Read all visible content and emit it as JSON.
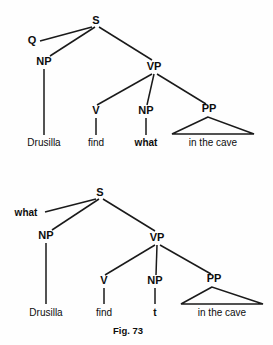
{
  "figure": {
    "caption": "Fig. 73",
    "caption_x": 128,
    "caption_y": 334,
    "caption_size": 9.5,
    "width": 273,
    "height": 345,
    "ink_color": "#1a1a1a",
    "background_color": "#fefefe"
  },
  "trees": [
    {
      "id": "tree-deep-structure",
      "name": "wh-question-deep-structure",
      "nodes": [
        {
          "id": "t1-S",
          "label": "S",
          "x": 96,
          "y": 24,
          "size": 11,
          "bold": true
        },
        {
          "id": "t1-Q",
          "label": "Q",
          "x": 32,
          "y": 44,
          "size": 11,
          "bold": true
        },
        {
          "id": "t1-NP",
          "label": "NP",
          "x": 44,
          "y": 65,
          "size": 11,
          "bold": true
        },
        {
          "id": "t1-VP",
          "label": "VP",
          "x": 154,
          "y": 70,
          "size": 11,
          "bold": true
        },
        {
          "id": "t1-V",
          "label": "V",
          "x": 96,
          "y": 114,
          "size": 11,
          "bold": true
        },
        {
          "id": "t1-NP2",
          "label": "NP",
          "x": 146,
          "y": 114,
          "size": 11,
          "bold": true
        },
        {
          "id": "t1-PP",
          "label": "PP",
          "x": 209,
          "y": 112,
          "size": 11,
          "bold": true
        }
      ],
      "edges": [
        {
          "name": "edge-S-Q",
          "x1": 92,
          "y1": 27,
          "x2": 40,
          "y2": 41
        },
        {
          "name": "edge-S-NP",
          "x1": 95,
          "y1": 27,
          "x2": 50,
          "y2": 56
        },
        {
          "name": "edge-S-VP",
          "x1": 99,
          "y1": 27,
          "x2": 152,
          "y2": 60
        },
        {
          "name": "edge-NP-Drusilla",
          "x1": 44,
          "y1": 69,
          "x2": 44,
          "y2": 135
        },
        {
          "name": "edge-VP-V",
          "x1": 152,
          "y1": 74,
          "x2": 97,
          "y2": 105
        },
        {
          "name": "edge-VP-NP",
          "x1": 154,
          "y1": 74,
          "x2": 147,
          "y2": 105
        },
        {
          "name": "edge-VP-PP",
          "x1": 157,
          "y1": 74,
          "x2": 206,
          "y2": 104
        },
        {
          "name": "edge-V-find",
          "x1": 96,
          "y1": 118,
          "x2": 96,
          "y2": 135
        },
        {
          "name": "edge-NP2-what",
          "x1": 146,
          "y1": 118,
          "x2": 146,
          "y2": 135
        }
      ],
      "triangles": [
        {
          "name": "pp-triangle",
          "apex_x": 208,
          "apex_y": 117,
          "left_x": 172,
          "right_x": 254,
          "base_y": 134
        }
      ],
      "leaves": [
        {
          "id": "t1-leaf-1",
          "name": "leaf-drusilla",
          "label": "Drusilla",
          "x": 44,
          "y": 146,
          "size": 10,
          "bold": false
        },
        {
          "id": "t1-leaf-2",
          "name": "leaf-find",
          "label": "find",
          "x": 96,
          "y": 146,
          "size": 10,
          "bold": false
        },
        {
          "id": "t1-leaf-3",
          "name": "leaf-what",
          "label": "what",
          "x": 146,
          "y": 146,
          "size": 10,
          "bold": true
        },
        {
          "id": "t1-leaf-4",
          "name": "leaf-in-the-cave",
          "label": "in the cave",
          "x": 213,
          "y": 146,
          "size": 10,
          "bold": false
        }
      ]
    },
    {
      "id": "tree-surface-structure",
      "name": "wh-question-surface-structure",
      "nodes": [
        {
          "id": "t2-S",
          "label": "S",
          "x": 100,
          "y": 196,
          "size": 11,
          "bold": true
        },
        {
          "id": "t2-NP",
          "label": "NP",
          "x": 46,
          "y": 239,
          "size": 11,
          "bold": true
        },
        {
          "id": "t2-VP",
          "label": "VP",
          "x": 157,
          "y": 241,
          "size": 11,
          "bold": true
        },
        {
          "id": "t2-V",
          "label": "V",
          "x": 104,
          "y": 284,
          "size": 11,
          "bold": true
        },
        {
          "id": "t2-NP2",
          "label": "NP",
          "x": 155,
          "y": 284,
          "size": 11,
          "bold": true
        },
        {
          "id": "t2-PP",
          "label": "PP",
          "x": 214,
          "y": 282,
          "size": 11,
          "bold": true
        }
      ],
      "fronted": [
        {
          "id": "t2-what",
          "name": "fronted-wh-what",
          "label": "what",
          "x": 26,
          "y": 216,
          "size": 10,
          "bold": true
        }
      ],
      "edges": [
        {
          "name": "edge-S-what",
          "x1": 96,
          "y1": 199,
          "x2": 45,
          "y2": 212
        },
        {
          "name": "edge-S-NP",
          "x1": 99,
          "y1": 199,
          "x2": 52,
          "y2": 230
        },
        {
          "name": "edge-S-VP",
          "x1": 103,
          "y1": 199,
          "x2": 155,
          "y2": 231
        },
        {
          "name": "edge-NP-Drusilla",
          "x1": 46,
          "y1": 243,
          "x2": 46,
          "y2": 304
        },
        {
          "name": "edge-VP-V",
          "x1": 155,
          "y1": 245,
          "x2": 105,
          "y2": 275
        },
        {
          "name": "edge-VP-NP",
          "x1": 157,
          "y1": 245,
          "x2": 156,
          "y2": 275
        },
        {
          "name": "edge-VP-PP",
          "x1": 160,
          "y1": 245,
          "x2": 211,
          "y2": 274
        },
        {
          "name": "edge-V-find",
          "x1": 104,
          "y1": 288,
          "x2": 104,
          "y2": 304
        },
        {
          "name": "edge-NP2-trace",
          "x1": 155,
          "y1": 288,
          "x2": 155,
          "y2": 304
        }
      ],
      "triangles": [
        {
          "name": "pp-triangle",
          "apex_x": 212,
          "apex_y": 287,
          "left_x": 181,
          "right_x": 263,
          "base_y": 304
        }
      ],
      "leaves": [
        {
          "id": "t2-leaf-1",
          "name": "leaf-drusilla",
          "label": "Drusilla",
          "x": 46,
          "y": 316,
          "size": 10,
          "bold": false
        },
        {
          "id": "t2-leaf-2",
          "name": "leaf-find",
          "label": "find",
          "x": 104,
          "y": 316,
          "size": 10,
          "bold": false
        },
        {
          "id": "t2-leaf-3",
          "name": "leaf-trace",
          "label": "t",
          "x": 155,
          "y": 316,
          "size": 10,
          "bold": true
        },
        {
          "id": "t2-leaf-4",
          "name": "leaf-in-the-cave",
          "label": "in the cave",
          "x": 222,
          "y": 316,
          "size": 10,
          "bold": false
        }
      ]
    }
  ]
}
